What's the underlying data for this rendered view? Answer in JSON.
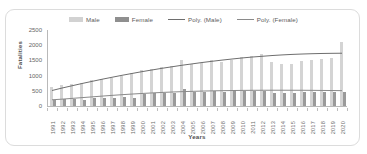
{
  "chart_data": {
    "type": "bar",
    "title": "",
    "xlabel": "Years",
    "ylabel": "Fatalities",
    "ylim": [
      0,
      2500
    ],
    "yticks": [
      0,
      500,
      1000,
      1500,
      2000,
      2500
    ],
    "grid": false,
    "legend_position": "top-center",
    "categories": [
      "1991",
      "1992",
      "1993",
      "1994",
      "1995",
      "1996",
      "1997",
      "1998",
      "1999",
      "2000",
      "2001",
      "2002",
      "2003",
      "2004",
      "2005",
      "2006",
      "2007",
      "2008",
      "2009",
      "2010",
      "2011",
      "2012",
      "2013",
      "2014",
      "2015",
      "2016",
      "2017",
      "2018",
      "2019",
      "2020"
    ],
    "series": [
      {
        "name": "Male",
        "type": "bar",
        "color": "#d4d4d4",
        "values": [
          630,
          700,
          730,
          760,
          860,
          900,
          920,
          1000,
          1080,
          1180,
          1230,
          1280,
          1320,
          1520,
          1380,
          1420,
          1510,
          1450,
          1530,
          1600,
          1660,
          1700,
          1450,
          1380,
          1380,
          1480,
          1530,
          1560,
          1590,
          2120
        ]
      },
      {
        "name": "Female",
        "type": "bar",
        "color": "#9a9a9a",
        "values": [
          210,
          215,
          220,
          185,
          260,
          280,
          250,
          290,
          250,
          410,
          420,
          420,
          430,
          560,
          470,
          470,
          480,
          470,
          540,
          480,
          480,
          480,
          440,
          430,
          430,
          450,
          460,
          460,
          460,
          450
        ]
      },
      {
        "name": "Poly. (Male)",
        "type": "line",
        "color": "#6e6e6e",
        "values": [
          510,
          590,
          665,
          740,
          810,
          880,
          945,
          1010,
          1070,
          1130,
          1185,
          1240,
          1290,
          1340,
          1385,
          1430,
          1470,
          1510,
          1545,
          1580,
          1610,
          1635,
          1660,
          1680,
          1697,
          1710,
          1720,
          1728,
          1733,
          1736
        ]
      },
      {
        "name": "Poly. (Female)",
        "type": "line",
        "color": "#8a8a8a",
        "values": [
          205,
          225,
          250,
          275,
          300,
          325,
          350,
          372,
          393,
          412,
          430,
          446,
          460,
          472,
          482,
          491,
          498,
          504,
          509,
          513,
          516,
          518,
          519,
          519,
          518,
          517,
          515,
          512,
          509,
          505
        ]
      }
    ]
  },
  "legend": {
    "items": [
      {
        "label": "Male",
        "marker": "bar",
        "color": "#d4d4d4"
      },
      {
        "label": "Female",
        "marker": "bar",
        "color": "#9a9a9a"
      },
      {
        "label": "Poly. (Male)",
        "marker": "line",
        "color": "#6e6e6e"
      },
      {
        "label": "Poly. (Female)",
        "marker": "line",
        "color": "#8a8a8a"
      }
    ]
  }
}
